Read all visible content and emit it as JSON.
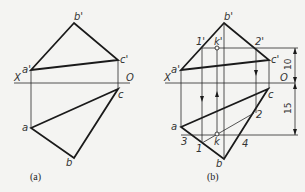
{
  "figure_a": {
    "caption": "(a)",
    "labels": {
      "b_prime": "b'",
      "a_prime": "a'",
      "c_prime": "c'",
      "x_axis": "X",
      "origin": "O",
      "a": "a",
      "b": "b",
      "c": "c"
    }
  },
  "figure_b": {
    "caption": "(b)",
    "labels": {
      "b_prime": "b'",
      "a_prime": "a'",
      "c_prime": "c'",
      "x_axis": "X",
      "origin": "O",
      "a": "a",
      "b": "b",
      "c": "c",
      "p1_prime": "1'",
      "k_prime": "k'",
      "p2_prime": "2'",
      "p1": "1",
      "p2": "2",
      "p3": "3",
      "p4": "4",
      "k": "k"
    },
    "dimensions": {
      "upper": "10",
      "lower": "15"
    }
  },
  "colors": {
    "line": "#1a1a1a",
    "background": "#f4f4f2"
  }
}
